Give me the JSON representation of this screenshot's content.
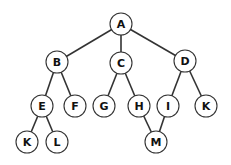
{
  "diagram": {
    "type": "tree",
    "node_radius": 11,
    "colors": {
      "stroke": "#333333",
      "fill": "#ffffff",
      "text": "#111111"
    },
    "nodes": [
      {
        "id": "A",
        "label": "A",
        "x": 121,
        "y": 24
      },
      {
        "id": "B",
        "label": "B",
        "x": 57,
        "y": 62
      },
      {
        "id": "C",
        "label": "C",
        "x": 121,
        "y": 63
      },
      {
        "id": "D",
        "label": "D",
        "x": 185,
        "y": 61
      },
      {
        "id": "E",
        "label": "E",
        "x": 42,
        "y": 106
      },
      {
        "id": "F",
        "label": "F",
        "x": 75,
        "y": 106
      },
      {
        "id": "G",
        "label": "G",
        "x": 104,
        "y": 106
      },
      {
        "id": "H",
        "label": "H",
        "x": 139,
        "y": 106
      },
      {
        "id": "I",
        "label": "I",
        "x": 168,
        "y": 106
      },
      {
        "id": "K2",
        "label": "K",
        "x": 206,
        "y": 106
      },
      {
        "id": "K1",
        "label": "K",
        "x": 27,
        "y": 142
      },
      {
        "id": "L",
        "label": "L",
        "x": 57,
        "y": 142
      },
      {
        "id": "M",
        "label": "M",
        "x": 156,
        "y": 142
      }
    ],
    "edges": [
      [
        "A",
        "B"
      ],
      [
        "A",
        "C"
      ],
      [
        "A",
        "D"
      ],
      [
        "B",
        "E"
      ],
      [
        "B",
        "F"
      ],
      [
        "C",
        "G"
      ],
      [
        "C",
        "H"
      ],
      [
        "D",
        "I"
      ],
      [
        "D",
        "K2"
      ],
      [
        "E",
        "K1"
      ],
      [
        "E",
        "L"
      ],
      [
        "H",
        "M"
      ],
      [
        "I",
        "M"
      ]
    ]
  }
}
